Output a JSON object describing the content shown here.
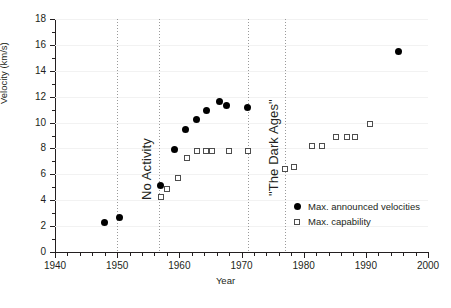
{
  "chart_data": {
    "type": "scatter",
    "title": "",
    "xlabel": "Year",
    "ylabel": "Velocity (km/s)",
    "xlim": [
      1940,
      2000
    ],
    "ylim": [
      0,
      18
    ],
    "xticks": [
      1940,
      1950,
      1960,
      1970,
      1980,
      1990,
      2000
    ],
    "yticks": [
      0,
      2,
      4,
      6,
      8,
      10,
      12,
      14,
      16,
      18
    ],
    "x_minor_tick_step": 2,
    "y_minor_tick_step": 1,
    "grid": "light-horizontal",
    "legend_position": "lower-right",
    "series": [
      {
        "name": "Max. announced velocities",
        "marker": "filled-circle",
        "color": "#000000",
        "points": [
          {
            "x": 1948.0,
            "y": 2.3
          },
          {
            "x": 1950.3,
            "y": 2.7
          },
          {
            "x": 1957.0,
            "y": 5.1
          },
          {
            "x": 1959.3,
            "y": 7.9
          },
          {
            "x": 1961.0,
            "y": 9.45
          },
          {
            "x": 1962.8,
            "y": 10.25
          },
          {
            "x": 1964.4,
            "y": 10.9
          },
          {
            "x": 1966.5,
            "y": 11.6
          },
          {
            "x": 1967.6,
            "y": 11.35
          },
          {
            "x": 1971.0,
            "y": 11.2
          },
          {
            "x": 1995.3,
            "y": 15.5
          }
        ]
      },
      {
        "name": "Max. capability",
        "marker": "open-square",
        "color": "#4d4d4d",
        "points": [
          {
            "x": 1957.0,
            "y": 4.25
          },
          {
            "x": 1958.0,
            "y": 4.9
          },
          {
            "x": 1959.8,
            "y": 5.7
          },
          {
            "x": 1961.3,
            "y": 7.3
          },
          {
            "x": 1962.8,
            "y": 7.8
          },
          {
            "x": 1964.3,
            "y": 7.8
          },
          {
            "x": 1965.2,
            "y": 7.8
          },
          {
            "x": 1968.0,
            "y": 7.8
          },
          {
            "x": 1971.1,
            "y": 7.8
          },
          {
            "x": 1977.0,
            "y": 6.4
          },
          {
            "x": 1978.4,
            "y": 6.6
          },
          {
            "x": 1981.3,
            "y": 8.2
          },
          {
            "x": 1982.9,
            "y": 8.2
          },
          {
            "x": 1985.2,
            "y": 8.9
          },
          {
            "x": 1986.9,
            "y": 8.9
          },
          {
            "x": 1988.3,
            "y": 8.9
          },
          {
            "x": 1990.6,
            "y": 9.9
          }
        ]
      }
    ],
    "annotations": [
      {
        "text": "No Activity",
        "x": 1953.5,
        "orientation": "vertical"
      },
      {
        "text": "\"The Dark Ages\"",
        "x": 1974.0,
        "orientation": "vertical"
      }
    ],
    "era_lines": [
      1950.0,
      1956.8,
      1971.0,
      1977.0
    ]
  }
}
